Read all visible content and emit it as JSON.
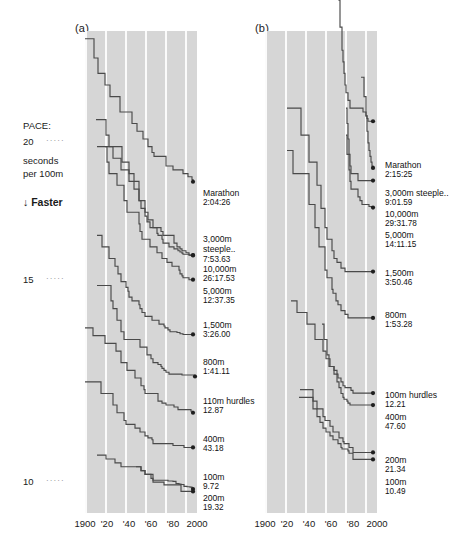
{
  "figure": {
    "panels": [
      {
        "id": "a",
        "label": "(a)",
        "title": "Men's world records",
        "x_ticks": [
          "1900",
          "'20",
          "'40",
          "'60",
          "'80",
          "2000"
        ],
        "series": [
          {
            "event": "Marathon",
            "time": "2:04:26"
          },
          {
            "event": "3,000m",
            "event2": "steeple..",
            "time": "7:53.63"
          },
          {
            "event": "10,000m",
            "time": "26:17.53"
          },
          {
            "event": "5,000m",
            "time": "12:37.35"
          },
          {
            "event": "1,500m",
            "time": "3:26.00"
          },
          {
            "event": "800m",
            "time": "1:41.11"
          },
          {
            "event": "110m hurdles",
            "time": "12.87"
          },
          {
            "event": "400m",
            "time": "43.18"
          },
          {
            "event": "100m",
            "time": "9.72"
          },
          {
            "event": "200m",
            "time": "19.32"
          }
        ]
      },
      {
        "id": "b",
        "label": "(b)",
        "title": "Women's world records",
        "x_ticks": [
          "1900",
          "'20",
          "'40",
          "'60",
          "'80",
          "2000"
        ],
        "series": [
          {
            "event": "Marathon",
            "time": "2:15:25"
          },
          {
            "event": "3,000m steeple..",
            "time": "9:01.59"
          },
          {
            "event": "10,000m",
            "time": "29:31.78"
          },
          {
            "event": "5,000m",
            "time": "14:11.15"
          },
          {
            "event": "1,500m",
            "time": "3:50.46"
          },
          {
            "event": "800m",
            "time": "1:53.28"
          },
          {
            "event": "100m hurdles",
            "time": "12.21"
          },
          {
            "event": "400m",
            "time": "47.60"
          },
          {
            "event": "200m",
            "time": "21.34"
          },
          {
            "event": "100m",
            "time": "10.49"
          }
        ]
      }
    ],
    "y_axis": {
      "caption_line1": "PACE:",
      "caption_line2": "seconds",
      "caption_line3": "per 100m",
      "direction_note": "Faster",
      "direction_arrow": "↓",
      "ticks": [
        {
          "value": "20",
          "dots": "·····"
        },
        {
          "value": "15",
          "dots": "·····"
        },
        {
          "value": "10",
          "dots": "·····"
        }
      ]
    },
    "colors": {
      "plot_background": "#d6d6d6",
      "gridline": "#fbfbfb",
      "line": "#4a4a4a",
      "marker": "#1f1f1f",
      "text": "#1a1a1a"
    }
  },
  "chart_data": {
    "type": "line",
    "xlabel": "Year",
    "ylabel": "PACE: seconds per 100m",
    "grid": true,
    "legend": "right-of-axes (direct labels)",
    "xlim": [
      1900,
      2010
    ],
    "ylim_inverted_note": "y axis is pace in seconds per 100m; lower = faster, plotted downward",
    "ylim": [
      21.5,
      9.0
    ],
    "yticks": [
      20,
      15,
      10
    ],
    "panels": [
      {
        "id": "a",
        "label": "(a)",
        "series": [
          {
            "name": "Marathon",
            "final_time": "2:04:26",
            "final_pace_s_per_100m": 17.69,
            "x": [
              1900,
              1909,
              1913,
              1920,
              1925,
              1935,
              1947,
              1952,
              1958,
              1963,
              1967,
              1969,
              1981,
              1988,
              1998,
              2003,
              2007,
              2008
            ],
            "y": [
              21.4,
              20.9,
              20.5,
              20.2,
              19.9,
              19.5,
              19.2,
              19.0,
              18.8,
              18.6,
              18.45,
              18.35,
              18.1,
              18.0,
              17.9,
              17.82,
              17.75,
              17.69
            ]
          },
          {
            "name": "3,000m steeple..",
            "final_time": "7:53.63",
            "final_pace_s_per_100m": 15.79,
            "x": [
              1920,
              1928,
              1936,
              1944,
              1954,
              1960,
              1963,
              1968,
              1976,
              1978,
              1989,
              1992,
              1995,
              1997,
              2001,
              2004
            ],
            "y": [
              18.6,
              18.3,
              18.0,
              17.7,
              17.2,
              16.9,
              16.7,
              16.5,
              16.4,
              16.3,
              16.1,
              16.0,
              15.95,
              15.9,
              15.85,
              15.79
            ]
          },
          {
            "name": "10,000m",
            "final_time": "26:17.53",
            "final_pace_s_per_100m": 15.78,
            "x": [
              1911,
              1921,
              1924,
              1937,
              1944,
              1949,
              1954,
              1956,
              1960,
              1962,
              1965,
              1972,
              1973,
              1977,
              1978,
              1984,
              1989,
              1993,
              1995,
              1997,
              1998,
              2004,
              2005
            ],
            "y": [
              19.3,
              18.9,
              18.6,
              18.2,
              17.9,
              17.5,
              17.2,
              17.0,
              16.8,
              16.65,
              16.5,
              16.35,
              16.3,
              16.2,
              16.1,
              16.0,
              15.95,
              15.9,
              15.87,
              15.84,
              15.81,
              15.79,
              15.78
            ]
          },
          {
            "name": "5,000m",
            "final_time": "12:37.35",
            "final_pace_s_per_100m": 15.15,
            "x": [
              1912,
              1922,
              1924,
              1932,
              1939,
              1942,
              1954,
              1955,
              1957,
              1965,
              1972,
              1977,
              1982,
              1987,
              1994,
              1995,
              1997,
              1998,
              2004
            ],
            "y": [
              18.6,
              18.2,
              17.9,
              17.6,
              17.2,
              16.9,
              16.6,
              16.4,
              16.2,
              16.0,
              15.85,
              15.7,
              15.6,
              15.5,
              15.4,
              15.3,
              15.25,
              15.2,
              15.15
            ]
          },
          {
            "name": "1,500m",
            "final_time": "3:26.00",
            "final_pace_s_per_100m": 13.73,
            "x": [
              1912,
              1917,
              1924,
              1930,
              1933,
              1936,
              1941,
              1943,
              1944,
              1947,
              1954,
              1955,
              1957,
              1960,
              1967,
              1974,
              1979,
              1980,
              1983,
              1985,
              1992,
              1995,
              1998
            ],
            "y": [
              16.3,
              16.0,
              15.7,
              15.5,
              15.3,
              15.1,
              14.95,
              14.85,
              14.7,
              14.6,
              14.5,
              14.4,
              14.3,
              14.2,
              14.1,
              14.0,
              13.95,
              13.9,
              13.85,
              13.8,
              13.78,
              13.75,
              13.73
            ]
          },
          {
            "name": "800m",
            "final_time": "1:41.11",
            "final_pace_s_per_100m": 12.64,
            "x": [
              1912,
              1926,
              1928,
              1932,
              1936,
              1939,
              1955,
              1962,
              1966,
              1968,
              1973,
              1976,
              1977,
              1979,
              1981,
              1984,
              1997,
              2010
            ],
            "y": [
              15.0,
              14.6,
              14.4,
              14.1,
              13.8,
              13.6,
              13.4,
              13.2,
              13.1,
              13.0,
              12.95,
              12.9,
              12.85,
              12.8,
              12.75,
              12.7,
              12.68,
              12.64
            ]
          },
          {
            "name": "110m hurdles",
            "final_time": "12.87",
            "final_pace_s_per_100m": 11.7,
            "x": [
              1900,
              1908,
              1920,
              1931,
              1936,
              1942,
              1950,
              1956,
              1959,
              1960,
              1973,
              1977,
              1981,
              1989,
              1993,
              2006,
              2008
            ],
            "y": [
              13.9,
              13.7,
              13.5,
              13.3,
              13.0,
              12.8,
              12.6,
              12.4,
              12.3,
              12.2,
              12.0,
              11.95,
              11.9,
              11.85,
              11.78,
              11.74,
              11.7
            ]
          },
          {
            "name": "400m",
            "final_time": "43.18",
            "final_pace_s_per_100m": 10.8,
            "x": [
              1900,
              1916,
              1928,
              1932,
              1939,
              1941,
              1950,
              1955,
              1960,
              1963,
              1967,
              1968,
              1988,
              1999
            ],
            "y": [
              12.5,
              12.2,
              11.9,
              11.7,
              11.5,
              11.4,
              11.3,
              11.2,
              11.1,
              11.05,
              11.0,
              10.9,
              10.85,
              10.8
            ]
          },
          {
            "name": "100m",
            "final_time": "9.72",
            "final_pace_s_per_100m": 9.72,
            "x": [
              1912,
              1921,
              1930,
              1936,
              1956,
              1960,
              1968,
              1983,
              1988,
              1991,
              1994,
              1996,
              1999,
              2002,
              2005,
              2007,
              2008
            ],
            "y": [
              10.6,
              10.5,
              10.4,
              10.3,
              10.2,
              10.1,
              9.95,
              9.93,
              9.92,
              9.86,
              9.85,
              9.84,
              9.79,
              9.78,
              9.77,
              9.74,
              9.72
            ]
          },
          {
            "name": "200m",
            "final_time": "19.32",
            "final_pace_s_per_100m": 9.66,
            "x": [
              1951,
              1956,
              1960,
              1966,
              1968,
              1979,
              1996
            ],
            "y": [
              10.3,
              10.2,
              10.1,
              10.0,
              9.9,
              9.83,
              9.66
            ]
          }
        ]
      },
      {
        "id": "b",
        "label": "(b)",
        "series": [
          {
            "name": "Marathon",
            "final_time": "2:15:25",
            "final_pace_s_per_100m": 19.26,
            "x": [
              1964,
              1967,
              1970,
              1971,
              1974,
              1975,
              1977,
              1978,
              1979,
              1980,
              1981,
              1983,
              1985,
              1998,
              2001,
              2002,
              2003
            ],
            "y": [
              25.5,
              24.6,
              23.8,
              23.2,
              22.4,
              21.7,
              21.1,
              20.8,
              20.5,
              20.2,
              20.0,
              19.8,
              19.6,
              19.5,
              19.4,
              19.33,
              19.26
            ]
          },
          {
            "name": "3,000m steeple..",
            "final_time": "9:01.59",
            "final_pace_s_per_100m": 18.05,
            "x": [
              1996,
              1999,
              2001,
              2002,
              2003,
              2004,
              2005,
              2006,
              2007,
              2008
            ],
            "y": [
              20.4,
              19.9,
              19.4,
              19.0,
              18.7,
              18.5,
              18.35,
              18.2,
              18.1,
              18.05
            ]
          },
          {
            "name": "10,000m",
            "final_time": "29:31.78",
            "final_pace_s_per_100m": 17.72,
            "x": [
              1981,
              1982,
              1983,
              1984,
              1985,
              1986,
              1993
            ],
            "y": [
              19.6,
              19.2,
              18.8,
              18.4,
              18.1,
              17.9,
              17.72
            ]
          },
          {
            "name": "5,000m",
            "final_time": "14:11.15",
            "final_pace_s_per_100m": 17.02,
            "x": [
              1981,
              1982,
              1984,
              1985,
              1986,
              1993,
              1995,
              1997,
              2004,
              2008
            ],
            "y": [
              18.9,
              18.4,
              18.0,
              17.7,
              17.5,
              17.3,
              17.2,
              17.1,
              17.05,
              17.02
            ]
          },
          {
            "name": "1,500m",
            "final_time": "3:50.46",
            "final_pace_s_per_100m": 15.36,
            "x": [
              1922,
              1936,
              1944,
              1952,
              1956,
              1960,
              1962,
              1967,
              1969,
              1972,
              1976,
              1980
            ],
            "y": [
              19.6,
              18.9,
              18.2,
              17.6,
              17.0,
              16.5,
              16.2,
              15.9,
              15.7,
              15.6,
              15.45,
              15.36
            ]
          },
          {
            "name": "800m",
            "final_time": "1:53.28",
            "final_pace_s_per_100m": 14.16,
            "x": [
              1922,
              1928,
              1944,
              1950,
              1954,
              1960,
              1962,
              1967,
              1968,
              1971,
              1973,
              1976,
              1980,
              1983
            ],
            "y": [
              18.5,
              17.9,
              17.1,
              16.5,
              16.0,
              15.4,
              15.2,
              14.9,
              14.8,
              14.6,
              14.5,
              14.35,
              14.25,
              14.16
            ]
          },
          {
            "name": "100m hurdles",
            "final_time": "12.21",
            "final_pace_s_per_100m": 12.21,
            "x": [
              1926,
              1932,
              1942,
              1950,
              1958,
              1961,
              1965,
              1969,
              1972,
              1973,
              1976,
              1978,
              1980,
              1986,
              1988
            ],
            "y": [
              14.6,
              14.3,
              14.0,
              13.6,
              13.3,
              13.1,
              12.9,
              12.8,
              12.7,
              12.6,
              12.5,
              12.4,
              12.35,
              12.28,
              12.21
            ]
          },
          {
            "name": "400m",
            "final_time": "47.60",
            "final_pace_s_per_100m": 11.9,
            "x": [
              1957,
              1959,
              1962,
              1964,
              1969,
              1972,
              1974,
              1976,
              1978,
              1979,
              1982,
              1983,
              1985
            ],
            "y": [
              14.0,
              13.6,
              13.2,
              12.9,
              12.7,
              12.5,
              12.35,
              12.2,
              12.1,
              12.05,
              12.0,
              11.95,
              11.9
            ]
          },
          {
            "name": "200m",
            "final_time": "21.34",
            "final_pace_s_per_100m": 10.67,
            "x": [
              1935,
              1948,
              1952,
              1958,
              1960,
              1965,
              1968,
              1974,
              1978,
              1979,
              1984,
              1988
            ],
            "y": [
              12.3,
              12.0,
              11.8,
              11.6,
              11.5,
              11.35,
              11.2,
              11.05,
              10.95,
              10.9,
              10.8,
              10.67
            ]
          },
          {
            "name": "100m",
            "final_time": "10.49",
            "final_pace_s_per_100m": 10.49,
            "x": [
              1934,
              1948,
              1952,
              1955,
              1958,
              1961,
              1965,
              1968,
              1973,
              1976,
              1977,
              1983,
              1984,
              1988
            ],
            "y": [
              12.1,
              11.8,
              11.6,
              11.45,
              11.3,
              11.2,
              11.1,
              11.0,
              10.9,
              10.8,
              10.76,
              10.71,
              10.65,
              10.49
            ]
          }
        ]
      }
    ]
  }
}
